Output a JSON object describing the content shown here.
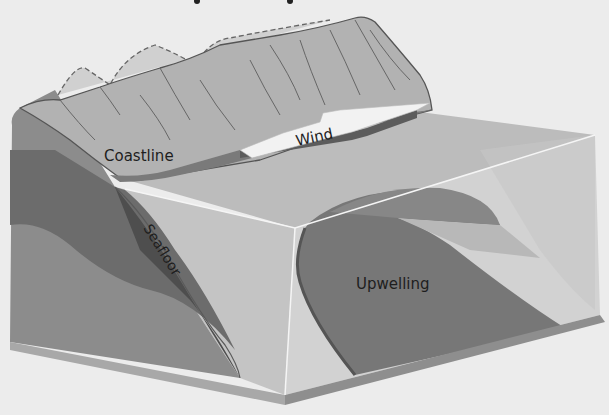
{
  "diagram": {
    "type": "block-diagram",
    "labels": {
      "coastline": "Coastline",
      "wind": "Wind",
      "seafloor": "Seafloor",
      "upwelling": "Upwelling"
    },
    "colors": {
      "background": "#ececec",
      "mountain": "#b4b4b4",
      "mountain_outline": "#555555",
      "ocean_surface": "#bdbdbd",
      "ocean_front_face": "#c4c4c4",
      "land_side_face": "#8a8a8a",
      "deep_seafloor": "#6a6a6a",
      "upwelling_current": "#747474",
      "arrow_top": "#f2f2f2",
      "arrow_side": "#5c5c5c",
      "base_plate": "#909090",
      "text": "#1e1e1e"
    }
  }
}
